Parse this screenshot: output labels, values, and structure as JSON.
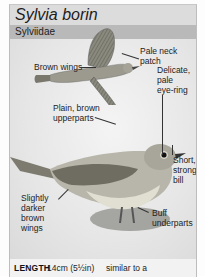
{
  "header": {
    "title": "Sylvia borin",
    "family": "Sylviidae"
  },
  "illustrations": {
    "flying_bird": "garden-warbler-in-flight",
    "perched_bird": "garden-warbler-perched"
  },
  "labels": {
    "pale_neck_patch": [
      "Pale neck",
      "patch"
    ],
    "brown_wings": [
      "Brown wings"
    ],
    "delicate_eye_ring": [
      "Delicate,",
      "pale",
      "eye-ring"
    ],
    "plain_upperparts": [
      "Plain, brown",
      "upperparts"
    ],
    "short_bill": [
      "Short,",
      "strong",
      "bill"
    ],
    "darker_wings": [
      "Slightly",
      "darker",
      "brown",
      "wings"
    ],
    "buff_underparts": [
      "Buff",
      "underparts"
    ]
  },
  "footer": {
    "length_key": "LENGTH",
    "length_value": "14cm (5½in)",
    "similar_text": "similar to a"
  }
}
